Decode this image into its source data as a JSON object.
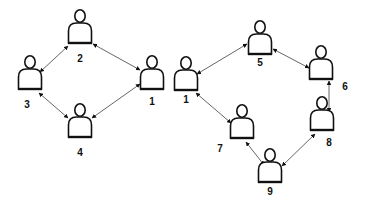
{
  "diagram": {
    "colors": {
      "background": "#ffffff",
      "stroke": "#111111",
      "edge": "#555555"
    },
    "graphs": [
      {
        "id": "left-ring",
        "nodes": [
          {
            "key": "L1",
            "label": "1",
            "icon": "person-icon",
            "head": [
              152,
              62
            ],
            "label_pos": [
              152,
              105
            ]
          },
          {
            "key": "L2",
            "label": "2",
            "icon": "person-icon",
            "head": [
              80,
              16
            ],
            "label_pos": [
              80,
              62
            ]
          },
          {
            "key": "L3",
            "label": "3",
            "icon": "person-icon",
            "head": [
              30,
              62
            ],
            "label_pos": [
              27,
              108
            ]
          },
          {
            "key": "L4",
            "label": "4",
            "icon": "person-icon",
            "head": [
              80,
              110
            ],
            "label_pos": [
              80,
              156
            ]
          }
        ],
        "edges": [
          {
            "from": "L2",
            "to": "L1",
            "bidirectional": true,
            "p1": [
              93,
              44
            ],
            "p2": [
              140,
              70
            ]
          },
          {
            "from": "L2",
            "to": "L3",
            "bidirectional": true,
            "p1": [
              68,
              46
            ],
            "p2": [
              40,
              72
            ]
          },
          {
            "from": "L3",
            "to": "L4",
            "bidirectional": true,
            "p1": [
              39,
              93
            ],
            "p2": [
              68,
              118
            ]
          },
          {
            "from": "L4",
            "to": "L1",
            "bidirectional": true,
            "p1": [
              92,
              118
            ],
            "p2": [
              140,
              84
            ]
          }
        ]
      },
      {
        "id": "right-ring",
        "nodes": [
          {
            "key": "R1",
            "label": "1",
            "icon": "person-icon",
            "head": [
              186,
              63
            ],
            "label_pos": [
              186,
              103
            ]
          },
          {
            "key": "R5",
            "label": "5",
            "icon": "person-icon",
            "head": [
              260,
              27
            ],
            "label_pos": [
              260,
              66
            ]
          },
          {
            "key": "R6",
            "label": "6",
            "icon": "person-icon",
            "head": [
              321,
              52
            ],
            "label_pos": [
              345,
              90
            ]
          },
          {
            "key": "R7",
            "label": "7",
            "icon": "person-icon",
            "head": [
              242,
              111
            ],
            "label_pos": [
              220,
              152
            ]
          },
          {
            "key": "R8",
            "label": "8",
            "icon": "person-icon",
            "head": [
              322,
              103
            ],
            "label_pos": [
              329,
              146
            ]
          },
          {
            "key": "R9",
            "label": "9",
            "icon": "person-icon",
            "head": [
              270,
              155
            ],
            "label_pos": [
              270,
              195
            ]
          }
        ],
        "edges": [
          {
            "from": "R1",
            "to": "R5",
            "bidirectional": true,
            "p1": [
              197,
              74
            ],
            "p2": [
              247,
              44
            ]
          },
          {
            "from": "R5",
            "to": "R6",
            "bidirectional": true,
            "p1": [
              273,
              49
            ],
            "p2": [
              309,
              68
            ]
          },
          {
            "from": "R1",
            "to": "R7",
            "bidirectional": true,
            "p1": [
              196,
              93
            ],
            "p2": [
              231,
              123
            ]
          },
          {
            "from": "R7",
            "to": "R9",
            "bidirectional": true,
            "p1": [
              246,
              142
            ],
            "p2": [
              264,
              165
            ]
          },
          {
            "from": "R9",
            "to": "R8",
            "bidirectional": true,
            "p1": [
              282,
              166
            ],
            "p2": [
              315,
              134
            ]
          },
          {
            "from": "R8",
            "to": "R6",
            "bidirectional": true,
            "p1": [
              329,
              112
            ],
            "p2": [
              329,
              81
            ]
          }
        ]
      }
    ]
  }
}
